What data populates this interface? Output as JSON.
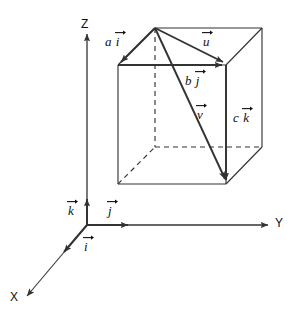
{
  "figure": {
    "background_color": "#ffffff",
    "line_color": "#333333",
    "text_color": "#111111"
  },
  "axes": {
    "origin_label": "",
    "items": [
      {
        "name": "x-axis",
        "label": "X",
        "direction": "down-left"
      },
      {
        "name": "y-axis",
        "label": "Y",
        "direction": "right"
      },
      {
        "name": "z-axis",
        "label": "Z",
        "direction": "up"
      }
    ]
  },
  "basis_vectors": [
    {
      "name": "i-hat",
      "base": "i",
      "coefficient": "",
      "label": "i"
    },
    {
      "name": "j-hat",
      "base": "j",
      "coefficient": "",
      "label": "j"
    },
    {
      "name": "k-hat",
      "base": "k",
      "coefficient": "",
      "label": "k"
    }
  ],
  "box_vectors": [
    {
      "name": "a-i-vector",
      "coefficient": "a",
      "base": "i"
    },
    {
      "name": "b-j-vector",
      "coefficient": "b",
      "base": "j"
    },
    {
      "name": "c-k-vector",
      "coefficient": "c",
      "base": "k"
    },
    {
      "name": "u-vector",
      "coefficient": "",
      "base": "u"
    },
    {
      "name": "v-vector",
      "coefficient": "",
      "base": "v"
    }
  ],
  "labels": {
    "axis_x": "X",
    "axis_y": "Y",
    "axis_z": "Z",
    "i_hat": "i",
    "j_hat": "j",
    "k_hat": "k",
    "a_coef": "a",
    "a_base": "i",
    "b_coef": "b",
    "b_base": "j",
    "c_coef": "c",
    "c_base": "k",
    "u_base": "u",
    "v_base": "v"
  }
}
